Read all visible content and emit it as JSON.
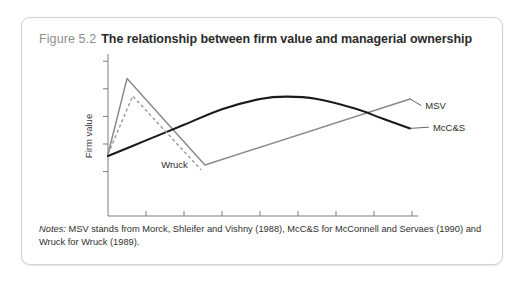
{
  "figure": {
    "number": "Figure 5.2",
    "title": "The relationship between firm value and managerial ownership",
    "notes_lead": "Notes:",
    "notes_body": " MSV stands from Morck, Shleifer and Vishny (1988), McC&S for McConnell and Servaes (1990) and Wruck for Wruck (1989)."
  },
  "colors": {
    "card_border": "#d2d2d2",
    "fig_number": "#8e8e8e",
    "title": "#2b2b2b",
    "axis": "#7d7d7d",
    "msv_line": "#8a8a8a",
    "mccs_line": "#1a1a1a",
    "wruck_line": "#9a9a9a"
  },
  "chart_data": {
    "type": "line",
    "title": "The relationship between firm value and managerial ownership",
    "xlabel": "Managerial ownership",
    "ylabel": "Firm value",
    "xlim": [
      0,
      0.8
    ],
    "ylim": [
      0,
      1
    ],
    "grid": false,
    "legend": "inline-labels",
    "xticks": [
      "0",
      "0.1",
      "0.2",
      "0.3",
      "0.4",
      "0.5",
      "0.6",
      "0.7",
      "0.8"
    ],
    "xtick_values": [
      0,
      0.1,
      0.2,
      0.3,
      0.4,
      0.5,
      0.6,
      0.7,
      0.8
    ],
    "ytick_values": [
      0.07,
      0.3,
      0.53,
      0.76,
      0.99
    ],
    "yticks": [
      "",
      "",
      "",
      "",
      ""
    ],
    "series": [
      {
        "name": "MSV",
        "style": "solid",
        "color": "#8a8a8a",
        "label_x": 0.835,
        "label_y": 0.62,
        "x": [
          0.0,
          0.05,
          0.255,
          0.795
        ],
        "y": [
          0.215,
          0.845,
          0.125,
          0.675
        ]
      },
      {
        "name": "McC&S",
        "style": "solid-curve",
        "color": "#1a1a1a",
        "label_x": 0.855,
        "label_y": 0.44,
        "x": [
          0.0,
          0.1,
          0.2,
          0.3,
          0.4,
          0.47,
          0.55,
          0.65,
          0.72,
          0.795
        ],
        "y": [
          0.2,
          0.33,
          0.46,
          0.59,
          0.675,
          0.695,
          0.675,
          0.595,
          0.515,
          0.43
        ]
      },
      {
        "name": "Wruck",
        "style": "dashed",
        "color": "#9a9a9a",
        "label_x": 0.175,
        "label_y": 0.125,
        "x": [
          0.0,
          0.065,
          0.245
        ],
        "y": [
          0.215,
          0.7,
          0.085
        ]
      }
    ]
  }
}
